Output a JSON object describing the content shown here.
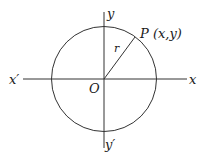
{
  "diagram": {
    "type": "unit-circle-coordinate-diagram",
    "stroke_color": "#333333",
    "labels": {
      "y_axis_positive": "y",
      "y_axis_negative": "y′",
      "x_axis_positive": "x",
      "x_axis_negative": "x′",
      "origin": "O",
      "point": "P (x,y)",
      "radius": "r"
    }
  }
}
